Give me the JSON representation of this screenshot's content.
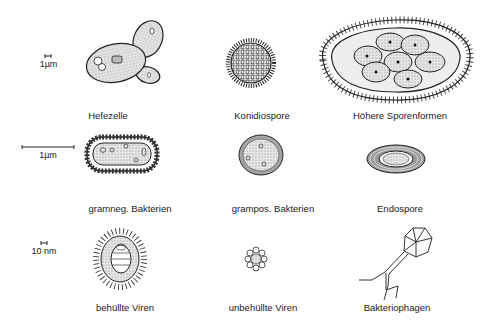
{
  "scales": {
    "row1": "1µm",
    "row2": "1µm",
    "row3": "10 nm"
  },
  "labels": {
    "hefezelle": "Hefezelle",
    "konidiospore": "Konidiospore",
    "hoehere_sporenformen": "Höhere Sporenformen",
    "gramneg": "gramneg. Bakterien",
    "grampos": "grampos. Bakterien",
    "endospore": "Endospore",
    "behuellte_viren": "behüllte Viren",
    "unbehuellte_viren": "unbehüllte Viren",
    "bakteriophagen": "Bakteriophagen"
  }
}
